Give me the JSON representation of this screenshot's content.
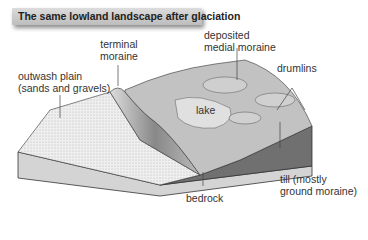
{
  "title": "The same lowland landscape after glaciation",
  "labels": {
    "terminal_moraine_1": "terminal",
    "terminal_moraine_2": "moraine",
    "outwash_1": "outwash plain",
    "outwash_2": "(sands and gravels)",
    "medial_1": "deposited",
    "medial_2": "medial moraine",
    "drumlins": "drumlins",
    "lake": "lake",
    "till_1": "till (mostly",
    "till_2": "ground moraine)",
    "bedrock": "bedrock"
  },
  "colors": {
    "outwash": "#ececec",
    "ground": "#bcbcbc",
    "dark_side": "#6e6e6e",
    "bedrock": "#d2d2d2"
  }
}
